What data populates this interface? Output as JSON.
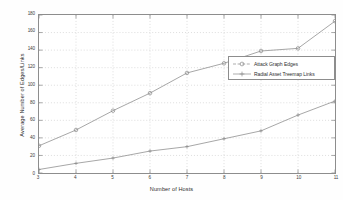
{
  "chart_data": {
    "type": "line",
    "title": "",
    "xlabel": "Number of Hosts",
    "ylabel": "Average Number of Edges/Links",
    "x": [
      3,
      4,
      5,
      6,
      7,
      8,
      9,
      10,
      11
    ],
    "xlim": [
      3,
      11
    ],
    "ylim": [
      0,
      180
    ],
    "xticks": [
      "3",
      "4",
      "5",
      "6",
      "7",
      "8",
      "9",
      "10",
      "11"
    ],
    "yticks": [
      "0",
      "20",
      "40",
      "60",
      "80",
      "100",
      "120",
      "140",
      "160",
      "180"
    ],
    "grid": true,
    "legend_position": "center-right",
    "series": [
      {
        "name": "Attack Graph Edges",
        "marker": "circle",
        "color": "#8a8a8a",
        "values": [
          31,
          49,
          71,
          91,
          114,
          125,
          139,
          142,
          173
        ]
      },
      {
        "name": "Radial Asset Treemap Links",
        "marker": "plus",
        "color": "#8a8a8a",
        "values": [
          4,
          11,
          17,
          25,
          30,
          39,
          48,
          66,
          82
        ]
      }
    ]
  },
  "legend": {
    "items": [
      {
        "label": "Attack Graph Edges"
      },
      {
        "label": "Radial Asset Treemap Links"
      }
    ]
  },
  "axes": {
    "x_title": "Number of Hosts",
    "y_title": "Average Number of Edges/Links"
  }
}
